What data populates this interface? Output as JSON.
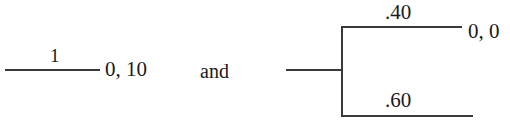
{
  "figure": {
    "type": "extensive-form-game-fragment",
    "background_color": "#ffffff",
    "line_color": "#3a3a3a",
    "text_color": "#1a1a1a"
  },
  "left_diagram": {
    "branch_label": "1",
    "payoff_label": "0, 10"
  },
  "conjunction": {
    "text": "and"
  },
  "right_diagram": {
    "top_branch_label": ".40",
    "bottom_branch_label": ".60",
    "top_payoff_label": "0, 0",
    "bottom_payoff_label": ""
  }
}
